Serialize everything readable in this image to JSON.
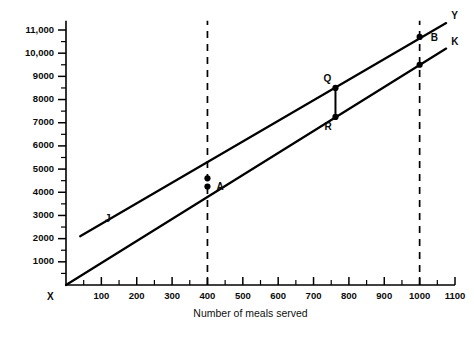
{
  "chart_data": {
    "type": "line",
    "title": "",
    "xlabel": "Number of meals served",
    "ylabel": "",
    "xlim": [
      0,
      1100
    ],
    "ylim": [
      0,
      11500
    ],
    "grid": false,
    "legend_position": "inline-end-labels",
    "x_ticks": [
      100,
      200,
      300,
      400,
      500,
      600,
      700,
      800,
      900,
      1000,
      1100
    ],
    "x_tick_labels": [
      "100",
      "200",
      "300",
      "400",
      "500",
      "600",
      "700",
      "800",
      "900",
      "1000",
      "1100"
    ],
    "x_minor_step": 50,
    "y_ticks": [
      1000,
      2000,
      3000,
      4000,
      5000,
      6000,
      7000,
      8000,
      9000,
      10000,
      11000
    ],
    "y_tick_labels": [
      "1000",
      "2000",
      "3000",
      "4000",
      "5000",
      "6000",
      "7000",
      "8000",
      "9000",
      "10,000",
      "11,000"
    ],
    "y_minor_step": 500,
    "origin_label": "X",
    "series": [
      {
        "name": "Y",
        "end_label": "Y",
        "x": [
          40,
          1075
        ],
        "values": [
          2100,
          11300
        ]
      },
      {
        "name": "K",
        "end_label": "K",
        "x": [
          0,
          1075
        ],
        "values": [
          0,
          10200
        ]
      }
    ],
    "annotations": [
      {
        "label": "A",
        "x": 400,
        "y": 4600,
        "label_dx": 9,
        "label_dy": 12,
        "marker": true
      },
      {
        "label": "A2",
        "x": 400,
        "y": 4250,
        "label_dx": 0,
        "label_dy": 0,
        "marker": true,
        "hide_label": true
      },
      {
        "label": "Q",
        "x": 762,
        "y": 8500,
        "label_dx": -12,
        "label_dy": -6,
        "marker": true
      },
      {
        "label": "R",
        "x": 762,
        "y": 7250,
        "label_dx": -11,
        "label_dy": 13,
        "marker": true
      },
      {
        "label": "B",
        "x": 1000,
        "y": 10700,
        "label_dx": 11,
        "label_dy": 4,
        "marker": true
      },
      {
        "label": "K1000",
        "x": 1000,
        "y": 9500,
        "label_dx": 0,
        "label_dy": 0,
        "marker": true,
        "hide_label": true
      },
      {
        "label": "J",
        "x": 110,
        "y": 2700,
        "label_dx": 0,
        "label_dy": 0,
        "marker": false
      }
    ],
    "reference_lines": [
      {
        "name": "dashed-400",
        "x": 400,
        "y_from": 0,
        "y_to": 11400,
        "style": "dashed"
      },
      {
        "name": "dashed-1000",
        "x": 1000,
        "y_from": 0,
        "y_to": 11400,
        "style": "dashed"
      }
    ],
    "connectors": [
      {
        "name": "qr-connector",
        "x": 762,
        "y_from": 7250,
        "y_to": 8500
      }
    ],
    "colors": {
      "ink": "#000000",
      "background": "#ffffff"
    }
  }
}
